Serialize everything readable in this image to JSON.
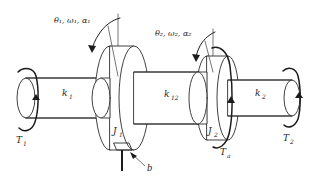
{
  "figure": {
    "type": "mechanical-schematic",
    "background_color": "#ffffff",
    "line_color": "#2b2b2b"
  },
  "labels": {
    "coord_left": "θ₁, ω₁, α₁",
    "coord_right": "θ₂, ω₂, α₂",
    "spring_left": "k",
    "spring_left_sub": "1",
    "spring_mid": "k",
    "spring_mid_sub": "12",
    "spring_right": "k",
    "spring_right_sub": "2",
    "inertia_left": "J",
    "inertia_left_sub": "1",
    "inertia_right": "J",
    "inertia_right_sub": "2",
    "torque_left": "T",
    "torque_left_sub": "1",
    "torque_right": "T",
    "torque_right_sub": "2",
    "torque_applied": "T",
    "torque_applied_sub": "a",
    "damping": "b"
  },
  "elements": {
    "shaft_left_name": "shaft-segment-k1",
    "shaft_mid_name": "shaft-segment-k12",
    "shaft_right_name": "shaft-segment-k2",
    "disc_left_name": "inertia-disc-J1",
    "disc_right_name": "inertia-disc-J2",
    "end_left_name": "shaft-end-left",
    "end_right_name": "shaft-end-right",
    "damper_name": "damper-b"
  }
}
